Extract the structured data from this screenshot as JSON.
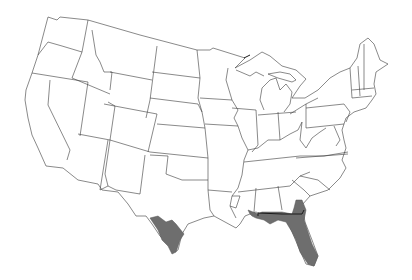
{
  "map": {
    "type": "species-range-map",
    "region": "contiguous-united-states",
    "boundaries": "state-outlines",
    "colors": {
      "background": "#ffffff",
      "state_fill": "#ffffff",
      "state_stroke": "#3a3a3a",
      "range_fill": "#6e6e6e"
    },
    "shaded_ranges": [
      {
        "name": "south-texas",
        "states": [
          "Texas"
        ]
      },
      {
        "name": "southeast",
        "states": [
          "Florida",
          "Georgia",
          "Alabama"
        ]
      }
    ]
  }
}
